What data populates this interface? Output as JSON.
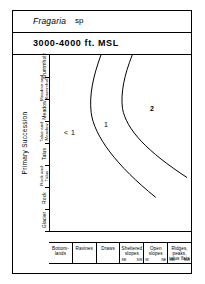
{
  "header": {
    "species": "Fragaria",
    "species_suffix": "sp",
    "elevation": "3000-4000 ft. MSL"
  },
  "chart_data": {
    "type": "line",
    "title": "Fragaria sp",
    "subtitle": "3000-4000 ft. MSL",
    "ylabel": "Primary Succession",
    "xlabel": "",
    "grid": false,
    "legend": "none",
    "y_categories": [
      "Krummholz",
      "Meadow and Krummholz",
      "Meadow",
      "Talus and Meadow",
      "Talus",
      "Rock and Talus",
      "Rock",
      "Glacier"
    ],
    "x_categories": [
      "Bottom-lands",
      "Ravines",
      "Draws",
      "Sheltered slopes",
      "Open slopes",
      "Ridges, peaks, talus flats"
    ],
    "x_sub_labels": [
      {
        "left": "",
        "right": ""
      },
      {
        "left": "",
        "right": ""
      },
      {
        "left": "",
        "right": ""
      },
      {
        "left": "SE",
        "right": "SW"
      },
      {
        "left": "W",
        "right": "NE"
      },
      {
        "left": "SW",
        "right": "NW"
      }
    ],
    "annotations": [
      {
        "label": "< 1",
        "x": 0.3,
        "y": 0.58
      },
      {
        "label": "1",
        "x": 0.5,
        "y": 0.52
      },
      {
        "label": "2",
        "x": 0.75,
        "y": 0.4
      }
    ],
    "series": [
      {
        "name": "contour-1",
        "path": "M 52 0 C 44 22, 40 40, 42 58 C 45 82, 68 112, 108 144"
      },
      {
        "name": "contour-2",
        "path": "M 84 0 C 76 20, 72 38, 74 54 C 78 76, 100 98, 140 124"
      }
    ]
  }
}
